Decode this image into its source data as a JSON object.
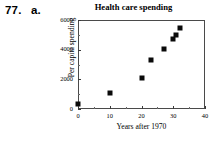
{
  "exercise": {
    "number": "77.",
    "part": "a."
  },
  "chart_data": {
    "type": "scatter",
    "title": "Health care spending",
    "xlabel": "Years after 1970",
    "ylabel": "Per capita spending",
    "xlim": [
      0,
      40
    ],
    "ylim": [
      0,
      6000
    ],
    "xticks": [
      0,
      10,
      20,
      30,
      40
    ],
    "xtick_labels": [
      "0",
      "10",
      "20",
      "30",
      "40"
    ],
    "xticks_minor": [
      5,
      15,
      25,
      35
    ],
    "yticks": [
      0,
      2000,
      4000,
      6000
    ],
    "ytick_labels": [
      "0",
      "2000",
      "4000",
      "6000"
    ],
    "yticks_minor": [
      1000,
      3000,
      5000
    ],
    "grid": false,
    "legend": null,
    "marker": "square",
    "marker_color": "#0a0a0a",
    "points": [
      {
        "x": 0,
        "y": 350
      },
      {
        "x": 10,
        "y": 1050
      },
      {
        "x": 20,
        "y": 2080
      },
      {
        "x": 23,
        "y": 3300
      },
      {
        "x": 27,
        "y": 4050
      },
      {
        "x": 30,
        "y": 4700
      },
      {
        "x": 31,
        "y": 5000
      },
      {
        "x": 32,
        "y": 5450
      }
    ]
  }
}
